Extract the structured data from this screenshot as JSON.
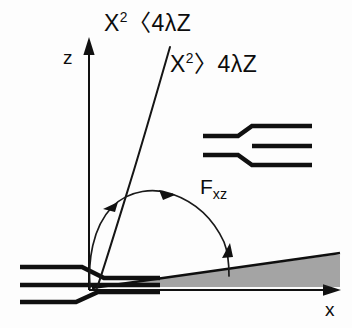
{
  "figure": {
    "domain": "diagram",
    "kind": "schematic-diffraction-regimes",
    "background_color": "#fdfdfd",
    "ink_color": "#101010",
    "width": 352,
    "height": 328
  },
  "axes": {
    "vertical": {
      "label": "z",
      "name": "z-axis",
      "origin_px": [
        89,
        290
      ],
      "tip_px": [
        89,
        42
      ],
      "has_arrowhead": true
    },
    "horizontal": {
      "label": "x",
      "name": "x-axis",
      "origin_px": [
        89,
        290
      ],
      "tip_px": [
        340,
        290
      ],
      "has_arrowhead": true
    }
  },
  "annotations": {
    "near_field": {
      "text_plain": "X2<4λZ",
      "base": "X",
      "exponent": "2",
      "relation": "〈",
      "rhs": "4λZ"
    },
    "far_field": {
      "text_plain": "X2>4λZ",
      "base": "X",
      "exponent": "2",
      "relation": "〉",
      "rhs": "4λZ"
    },
    "force": {
      "symbol": "F",
      "subscript": "xz",
      "text_plain": "Fxz"
    }
  },
  "elements": {
    "parabola": {
      "name": "boundary-curve",
      "meaning": "X^2 = 4λZ separatrix between near-field and far-field regions"
    },
    "arc_arrow": {
      "name": "curved-double-arrow",
      "arrowhead_count": 3,
      "meaning": "rotation / mapping between the two regimes"
    },
    "wedge": {
      "name": "hatched-wedge",
      "apex_px": [
        92,
        288
      ],
      "hatch_count": 16,
      "meaning": "diverging far-field beam"
    },
    "waveguide": {
      "name": "tapered-waveguide",
      "line_count": 3,
      "meaning": "input guide with step taper at origin"
    },
    "inset": {
      "name": "inset-taper-detail",
      "line_count": 3,
      "meaning": "detail of the outward step transition"
    }
  }
}
